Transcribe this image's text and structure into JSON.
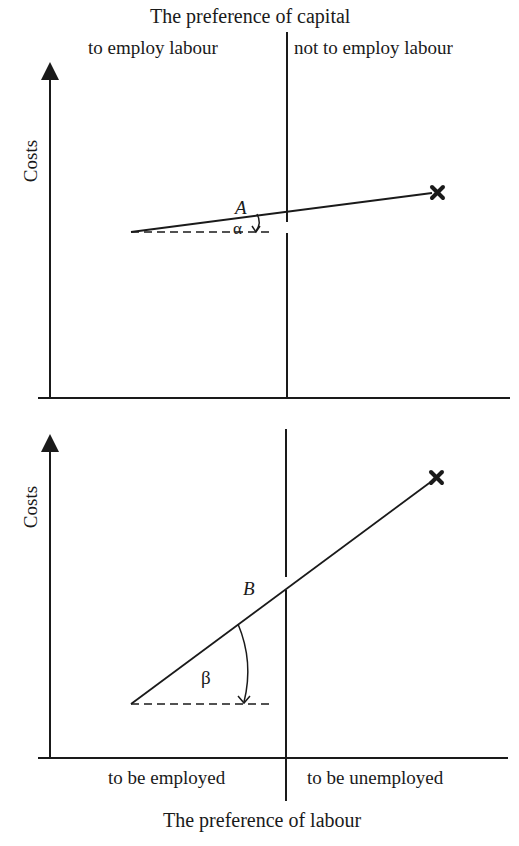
{
  "top_title": "The preference of capital",
  "top_left_label": "to employ labour",
  "top_right_label": "not to employ labour",
  "bottom_title": "The preference of labour",
  "bottom_left_label": "to be employed",
  "bottom_right_label": "to be unemployed",
  "panels": [
    {
      "y_axis_label": "Costs",
      "line_label": "A",
      "angle_label": "α"
    },
    {
      "y_axis_label": "Costs",
      "line_label": "B",
      "angle_label": "β"
    }
  ],
  "colors": {
    "ink": "#1a1a1a",
    "background": "#ffffff"
  }
}
